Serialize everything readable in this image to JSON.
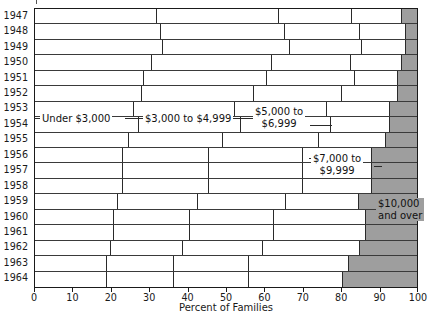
{
  "chart_data": {
    "type": "bar",
    "orientation": "horizontal",
    "stacked": true,
    "title": "",
    "xlabel": "Percent of Families",
    "ylabel": "",
    "xlim": [
      0,
      100
    ],
    "grid": false,
    "legend": "inline-annotations",
    "xticks": [
      0,
      10,
      20,
      30,
      40,
      50,
      60,
      70,
      80,
      90,
      100
    ],
    "xticklabels": [
      "0",
      "10",
      "20",
      "30",
      "40",
      "50",
      "60",
      "70",
      "80",
      "90",
      "100"
    ],
    "categories": [
      "1947",
      "1948",
      "1949",
      "1950",
      "1951",
      "1952",
      "1953",
      "1954",
      "1955",
      "1956",
      "1957",
      "1958",
      "1959",
      "1960",
      "1961",
      "1962",
      "1963",
      "1964"
    ],
    "series": [
      {
        "name": "Under $3,000",
        "color": "#ffffff",
        "values": [
          32.0,
          33.0,
          33.4,
          30.7,
          28.6,
          28.0,
          26.0,
          27.3,
          24.7,
          23.0,
          23.0,
          23.0,
          21.8,
          20.8,
          20.8,
          19.8,
          18.8,
          18.8
        ]
      },
      {
        "name": "$3,000 to $4,999",
        "color": "#ffffff",
        "values": [
          32.0,
          32.4,
          33.3,
          31.3,
          32.1,
          29.3,
          26.3,
          26.7,
          24.5,
          22.6,
          22.6,
          22.6,
          21.0,
          19.8,
          19.8,
          19.0,
          17.5,
          17.5
        ]
      },
      {
        "name": "$5,000 to $6,999",
        "color": "#ffffff",
        "values": [
          19.0,
          19.6,
          18.8,
          20.7,
          23.1,
          23.1,
          24.2,
          23.5,
          25.2,
          24.6,
          24.6,
          24.6,
          23.0,
          22.0,
          22.0,
          20.9,
          19.8,
          19.8
        ]
      },
      {
        "name": "$7,000 to $9,999",
        "color": "#ffffff",
        "values": [
          13.0,
          12.0,
          11.5,
          13.3,
          11.2,
          14.6,
          16.5,
          15.5,
          17.6,
          18.0,
          18.0,
          18.0,
          19.0,
          24.1,
          24.1,
          25.3,
          26.0,
          24.4
        ]
      },
      {
        "name": "$10,000 and over",
        "color": "#9e9e9e",
        "values": [
          4.0,
          3.0,
          3.0,
          4.0,
          5.0,
          5.0,
          7.0,
          7.0,
          8.0,
          9.8,
          9.8,
          9.8,
          15.2,
          13.3,
          13.3,
          15.0,
          17.9,
          19.5
        ]
      }
    ],
    "annotations": [
      {
        "text": "Under $3,000",
        "row_anchor": "1953-1954"
      },
      {
        "text": "$3,000 to $4,999",
        "row_anchor": "1953-1954"
      },
      {
        "text": "$5,000 to\n$6,999",
        "row_anchor": "1953-1954"
      },
      {
        "text": "$7,000 to\n$9,999",
        "row_anchor": "1956-1957"
      },
      {
        "text": "$10,000\nand over",
        "row_anchor": "1959-1960"
      }
    ]
  },
  "axis": {
    "x_title": "Percent of Families"
  },
  "labels": {
    "ann_under3000": "Under $3,000",
    "ann_3000_4999": "$3,000 to $4,999",
    "ann_5000_6999_l1": "$5,000 to",
    "ann_5000_6999_l2": "$6,999",
    "ann_7000_9999_l1": "$7,000 to",
    "ann_7000_9999_l2": "$9,999",
    "ann_10000_l1": "$10,000",
    "ann_10000_l2": "and over"
  },
  "colors": {
    "bar_fill": "#ffffff",
    "top_bracket_fill": "#9e9e9e",
    "line": "#1a1a1a"
  }
}
